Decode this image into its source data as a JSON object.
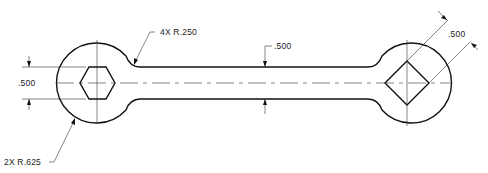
{
  "drawing": {
    "title": "Wrench part drawing",
    "dimensions": {
      "fillet_radius": "4X  R.250",
      "shaft_width": ".500",
      "hex_across_flats": ".500",
      "end_radius": "2X  R.625",
      "square_across_flats": ".500"
    },
    "colors": {
      "line": "#111111",
      "background": "#ffffff"
    }
  }
}
